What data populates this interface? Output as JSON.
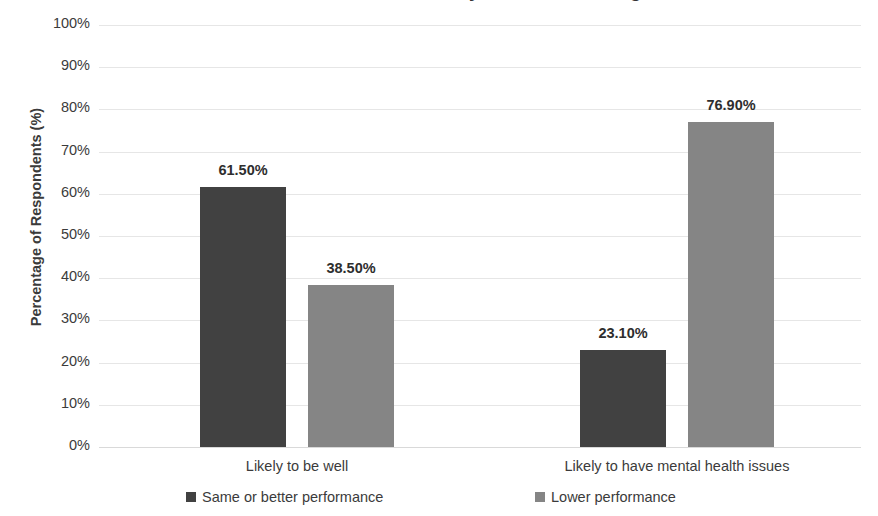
{
  "chart_data": {
    "type": "bar",
    "title": "Perceived Performance by Mental Wellbeing",
    "xlabel": "",
    "ylabel": "Percentage of Respondents (%)",
    "ylim": [
      0,
      100
    ],
    "ytick_labels": [
      "100%",
      "90%",
      "80%",
      "70%",
      "60%",
      "50%",
      "40%",
      "30%",
      "20%",
      "10%",
      "0%"
    ],
    "ytick_values": [
      100,
      90,
      80,
      70,
      60,
      50,
      40,
      30,
      20,
      10,
      0
    ],
    "grid": true,
    "legend_position": "bottom",
    "categories": [
      "Likely to be well",
      "Likely to have mental health issues"
    ],
    "series": [
      {
        "name": "Same or better performance",
        "color": "#414141",
        "values": [
          61.5,
          38.5
        ],
        "data_labels": [
          "61.50%",
          "23.10%"
        ]
      },
      {
        "name": "Lower performance",
        "color": "#858585",
        "values": [
          38.5,
          76.9
        ],
        "data_labels": [
          "38.50%",
          "76.90%"
        ]
      }
    ],
    "bars": [
      {
        "group": 0,
        "series": 0,
        "label": "61.50%",
        "value": 61.5,
        "color": "#414141",
        "left": 200,
        "width": 86
      },
      {
        "group": 0,
        "series": 1,
        "label": "38.50%",
        "value": 38.5,
        "color": "#858585",
        "left": 308,
        "width": 86
      },
      {
        "group": 1,
        "series": 0,
        "label": "23.10%",
        "value": 23.1,
        "color": "#414141",
        "left": 580,
        "width": 86
      },
      {
        "group": 1,
        "series": 1,
        "label": "76.90%",
        "value": 76.9,
        "color": "#858585",
        "left": 688,
        "width": 86
      }
    ],
    "category_label_centers": [
      297,
      677
    ]
  },
  "legend": {
    "items": [
      {
        "label": "Same or better performance",
        "color": "#414141",
        "left": 186
      },
      {
        "label": "Lower performance",
        "color": "#858585",
        "left": 535
      }
    ]
  },
  "colors": {
    "series_dark": "#414141",
    "series_light": "#858585",
    "gridline": "#e6e6e6",
    "text": "#3b3b3b",
    "background": "#ffffff"
  }
}
